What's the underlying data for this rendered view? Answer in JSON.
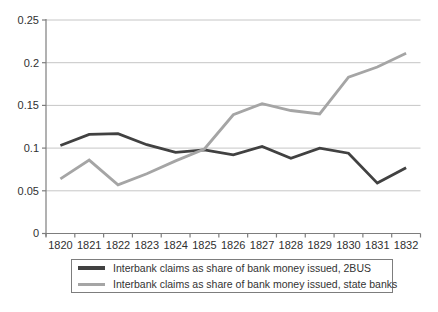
{
  "figure": {
    "background": "#ffffff"
  },
  "chart_data": {
    "type": "line",
    "title": "",
    "xlabel": "",
    "ylabel": "",
    "categories": [
      "1820",
      "1821",
      "1822",
      "1823",
      "1824",
      "1825",
      "1826",
      "1827",
      "1828",
      "1829",
      "1830",
      "1831",
      "1832"
    ],
    "series": [
      {
        "key": "2bus",
        "name": "Interbank claims as share of bank money issued, 2BUS",
        "color": "#414141",
        "stroke_width": 2.8,
        "values": [
          0.103,
          0.116,
          0.117,
          0.104,
          0.095,
          0.098,
          0.092,
          0.102,
          0.088,
          0.1,
          0.094,
          0.059,
          0.077
        ]
      },
      {
        "key": "state-banks",
        "name": "Interbank claims as share of bank money issued, state banks",
        "color": "#a5a5a5",
        "stroke_width": 2.8,
        "values": [
          0.064,
          0.086,
          0.057,
          0.07,
          0.085,
          0.099,
          0.139,
          0.152,
          0.144,
          0.14,
          0.183,
          0.195,
          0.211
        ]
      }
    ],
    "ylim": [
      0,
      0.25
    ],
    "yticks": [
      0,
      0.05,
      0.1,
      0.15,
      0.2,
      0.25
    ],
    "ytick_labels": [
      "0",
      "0.05",
      "0.1",
      "0.15",
      "0.2",
      "0.25"
    ],
    "grid": "horizontal",
    "legend_position": "bottom-boxed",
    "colors": {
      "gridline": "#c6c6c6",
      "axis": "#7d7d7d",
      "tick": "#7d7d7d",
      "text": "#303030",
      "legend_border": "#7d7d7d"
    }
  }
}
